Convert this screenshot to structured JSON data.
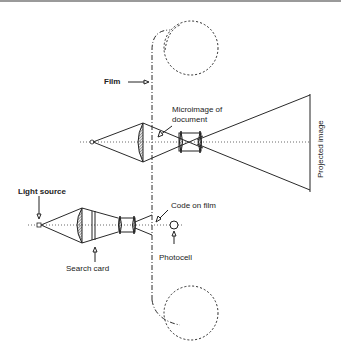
{
  "diagram": {
    "labels": {
      "film": "Film",
      "microimage": "Microimage of document",
      "microimage_line1": "Microimage of",
      "microimage_line2": "document",
      "projected_image": "Projected image",
      "light_source": "Light source",
      "code_on_film": "Code on film",
      "search_card": "Search card",
      "photocell": "Photocell"
    },
    "components": [
      {
        "id": "film-reel-top",
        "type": "reel"
      },
      {
        "id": "film-strip",
        "type": "dash-dot line"
      },
      {
        "id": "film-reel-bottom",
        "type": "reel"
      },
      {
        "id": "upper-light-source",
        "type": "point source"
      },
      {
        "id": "upper-condenser-lens",
        "type": "lens"
      },
      {
        "id": "upper-projection-lens",
        "type": "lens pair"
      },
      {
        "id": "projected-image-screen",
        "type": "screen"
      },
      {
        "id": "lower-light-source",
        "type": "point source"
      },
      {
        "id": "lower-condenser-lens",
        "type": "lens"
      },
      {
        "id": "search-card",
        "type": "plate"
      },
      {
        "id": "lower-lens-pair",
        "type": "lens pair"
      },
      {
        "id": "photocell",
        "type": "detector"
      }
    ],
    "colors": {
      "line": "#2a2a2a",
      "background": "#ffffff",
      "top_rule": "#9a9a9a"
    }
  }
}
